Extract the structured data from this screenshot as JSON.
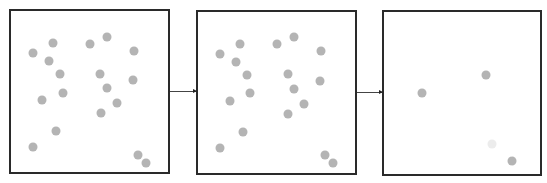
{
  "diagram": {
    "panels": [
      {
        "id": "stage-1",
        "x": 9,
        "y": 9,
        "w": 161,
        "h": 165,
        "dots": [
          [
            33,
            53
          ],
          [
            53,
            43
          ],
          [
            49,
            61
          ],
          [
            90,
            44
          ],
          [
            107,
            37
          ],
          [
            134,
            51
          ],
          [
            60,
            74
          ],
          [
            100,
            74
          ],
          [
            133,
            80
          ],
          [
            107,
            88
          ],
          [
            63,
            93
          ],
          [
            42,
            100
          ],
          [
            117,
            103
          ],
          [
            101,
            113
          ],
          [
            56,
            131
          ],
          [
            33,
            147
          ],
          [
            138,
            155
          ],
          [
            146,
            163
          ]
        ]
      },
      {
        "id": "stage-2",
        "x": 196,
        "y": 10,
        "w": 161,
        "h": 165,
        "dots": [
          [
            220,
            54
          ],
          [
            240,
            44
          ],
          [
            236,
            62
          ],
          [
            277,
            44
          ],
          [
            294,
            37
          ],
          [
            321,
            51
          ],
          [
            247,
            75
          ],
          [
            288,
            74
          ],
          [
            320,
            81
          ],
          [
            294,
            89
          ],
          [
            250,
            93
          ],
          [
            230,
            101
          ],
          [
            304,
            104
          ],
          [
            288,
            114
          ],
          [
            243,
            132
          ],
          [
            220,
            148
          ],
          [
            325,
            155
          ],
          [
            333,
            163
          ]
        ]
      },
      {
        "id": "stage-3",
        "x": 382,
        "y": 10,
        "w": 160,
        "h": 166,
        "dots": [
          [
            422,
            93
          ],
          [
            486,
            75
          ],
          [
            512,
            161
          ]
        ],
        "faint_dots": [
          [
            492,
            144
          ]
        ]
      }
    ],
    "arrows": [
      {
        "from": "stage-1",
        "to": "stage-2",
        "x1": 170,
        "x2": 196,
        "y": 91
      },
      {
        "from": "stage-2",
        "to": "stage-3",
        "x1": 357,
        "x2": 382,
        "y": 92
      }
    ],
    "colors": {
      "dot": "#b4b4b4",
      "border": "#2a2a2a",
      "arrow": "#444444"
    }
  }
}
